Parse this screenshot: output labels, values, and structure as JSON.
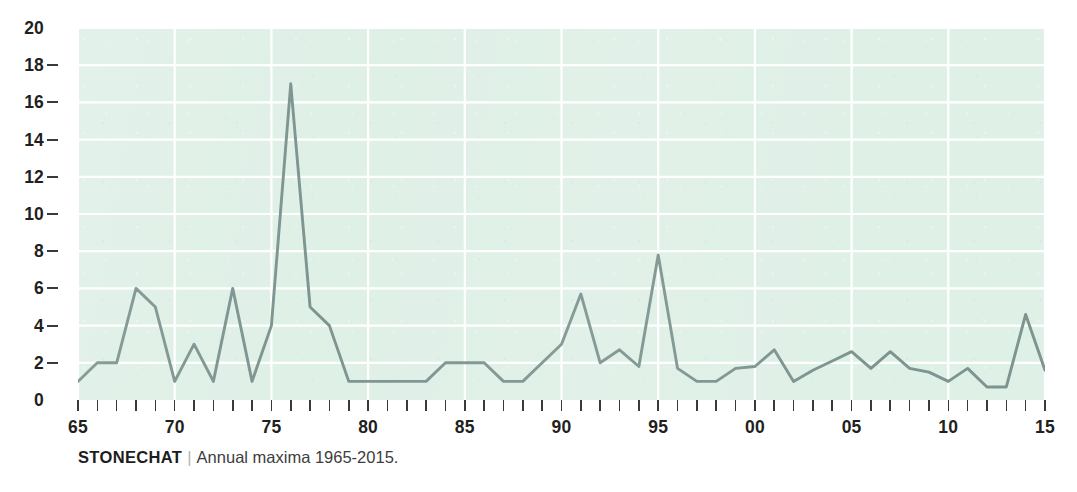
{
  "caption": {
    "species": "STONECHAT",
    "separator": "|",
    "description": "Annual maxima 1965-2015."
  },
  "colors": {
    "plot_background": "#dff0e7",
    "line": "#7d9490",
    "gridline": "#ffffff",
    "axis_text": "#231f20",
    "caption_text": "#3d3d3d"
  },
  "chart_data": {
    "type": "line",
    "title": "STONECHAT",
    "subtitle": "Annual maxima 1965-2015.",
    "xlabel": "",
    "ylabel": "",
    "xlim": [
      1965,
      2015
    ],
    "ylim": [
      0,
      20
    ],
    "ytick_values": [
      0,
      2,
      4,
      6,
      8,
      10,
      12,
      14,
      16,
      18,
      20
    ],
    "ytick_labels": [
      "0",
      "2",
      "4",
      "6",
      "8",
      "10",
      "12",
      "14",
      "16",
      "18",
      "20"
    ],
    "xtick_values": [
      1965,
      1970,
      1975,
      1980,
      1985,
      1990,
      1995,
      2000,
      2005,
      2010,
      2015
    ],
    "xtick_labels": [
      "65",
      "70",
      "75",
      "80",
      "85",
      "90",
      "95",
      "00",
      "05",
      "10",
      "15"
    ],
    "xminor_every": 1,
    "grid": true,
    "grid_axis": "both",
    "legend": false,
    "x": [
      1965,
      1966,
      1967,
      1968,
      1969,
      1970,
      1971,
      1972,
      1973,
      1974,
      1975,
      1976,
      1977,
      1978,
      1979,
      1980,
      1981,
      1982,
      1983,
      1984,
      1985,
      1986,
      1987,
      1988,
      1989,
      1990,
      1991,
      1992,
      1993,
      1994,
      1995,
      1996,
      1997,
      1998,
      1999,
      2000,
      2001,
      2002,
      2003,
      2004,
      2005,
      2006,
      2007,
      2008,
      2009,
      2010,
      2011,
      2012,
      2013,
      2014,
      2015
    ],
    "values": [
      1,
      2,
      2,
      6,
      5,
      1,
      3,
      1,
      6,
      1,
      4,
      17,
      5,
      4,
      1,
      1,
      1,
      1,
      1,
      2,
      2,
      2,
      1,
      1,
      2,
      3,
      5.7,
      2,
      2.7,
      1.8,
      7.8,
      1.7,
      1,
      1,
      1.7,
      1.8,
      2.7,
      1,
      1.6,
      2.1,
      2.6,
      1.7,
      2.6,
      1.7,
      1.5,
      1,
      1.7,
      0.7,
      0.7,
      4.6,
      1.6
    ],
    "series_name": "Annual maxima",
    "notable_points": [
      {
        "x": 1976,
        "y": 17,
        "note": "highest annual maximum"
      },
      {
        "x": 1995,
        "y": 7.8,
        "note": "secondary peak"
      },
      {
        "x": 1991,
        "y": 5.7,
        "note": "peak"
      },
      {
        "x": 2014,
        "y": 4.6,
        "note": "late peak"
      }
    ]
  }
}
